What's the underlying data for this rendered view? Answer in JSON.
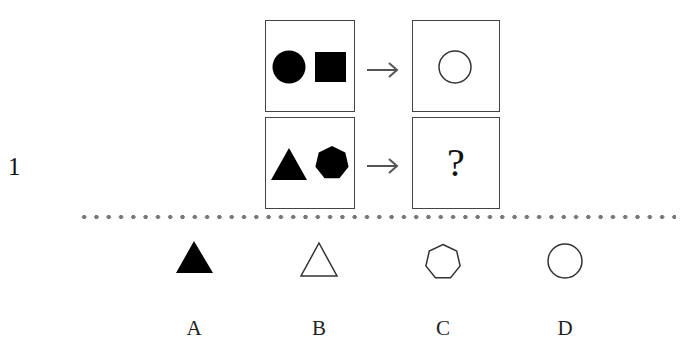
{
  "question": {
    "number": "1",
    "question_mark": "?",
    "colors": {
      "frame_border": "#444444",
      "filled_shape": "#000000",
      "outline_shape": "#333333",
      "arrow": "#555555",
      "divider_dots": "#777777"
    },
    "example_row": {
      "input_shapes": [
        "filled-circle",
        "filled-square"
      ],
      "output_shape": "outline-circle"
    },
    "query_row": {
      "input_shapes": [
        "filled-triangle",
        "filled-heptagon"
      ],
      "output_shape": "unknown"
    }
  },
  "options": [
    {
      "label": "A",
      "shape": "filled-triangle"
    },
    {
      "label": "B",
      "shape": "outline-triangle"
    },
    {
      "label": "C",
      "shape": "outline-heptagon"
    },
    {
      "label": "D",
      "shape": "outline-circle"
    }
  ]
}
